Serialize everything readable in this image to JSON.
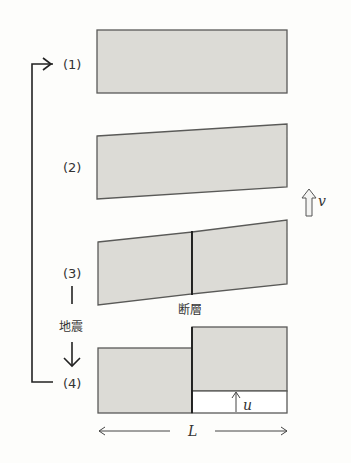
{
  "diagram": {
    "type": "elastic-rebound-fault-sequence",
    "colors": {
      "block_fill": "#dcdbd6",
      "block_stroke": "#5a5a58",
      "fault_line": "#1a1a1a",
      "background": "#fdfdfb"
    },
    "stages": [
      {
        "label": "(1)",
        "description": "undeformed block"
      },
      {
        "label": "(2)",
        "description": "block tilted by strain accumulation"
      },
      {
        "label": "(3)",
        "description": "strained block with fault"
      },
      {
        "label": "(4)",
        "description": "blocks displaced after earthquake"
      }
    ],
    "fault_label": "断層",
    "earthquake_label": "地震",
    "velocity_symbol": "v",
    "displacement_symbol": "u",
    "length_symbol": "L"
  }
}
